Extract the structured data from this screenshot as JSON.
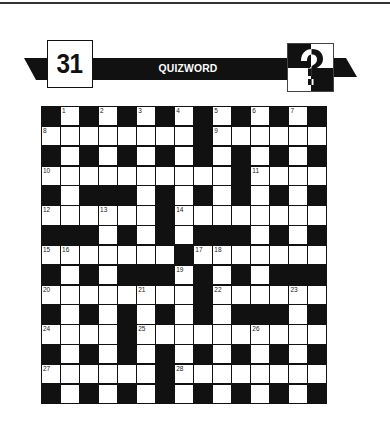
{
  "header": {
    "puzzle_number": "31",
    "title": "QUIZWORD",
    "logo_icon": "question-mark-icon"
  },
  "colors": {
    "ink": "#111111",
    "paper": "#ffffff"
  },
  "grid": {
    "rows": 15,
    "cols": 15,
    "layout": [
      "#1#2#3#4#5#6#7#",
      "........#......",
      "#.#.#.#.#.#.#.#",
      "..........#....",
      "#.###.#.#.#.#.#",
      "......#........",
      "###.#.#.###.#.#",
      ".......#.......",
      "#.#.###.#.#.###",
      "........#......",
      "#.#.#.#.#.###.#",
      "....#..........",
      "#.#.#.#.#.#.#.#",
      "......#........",
      "#.#.#.#.#.#.#.#"
    ],
    "numbers": [
      {
        "n": "1",
        "r": 0,
        "c": 1
      },
      {
        "n": "2",
        "r": 0,
        "c": 3
      },
      {
        "n": "3",
        "r": 0,
        "c": 5
      },
      {
        "n": "4",
        "r": 0,
        "c": 7
      },
      {
        "n": "5",
        "r": 0,
        "c": 9
      },
      {
        "n": "6",
        "r": 0,
        "c": 11
      },
      {
        "n": "7",
        "r": 0,
        "c": 13
      },
      {
        "n": "8",
        "r": 1,
        "c": 0
      },
      {
        "n": "9",
        "r": 1,
        "c": 9
      },
      {
        "n": "10",
        "r": 3,
        "c": 0
      },
      {
        "n": "11",
        "r": 3,
        "c": 11
      },
      {
        "n": "12",
        "r": 5,
        "c": 0
      },
      {
        "n": "13",
        "r": 5,
        "c": 3
      },
      {
        "n": "14",
        "r": 5,
        "c": 7
      },
      {
        "n": "15",
        "r": 7,
        "c": 0
      },
      {
        "n": "16",
        "r": 7,
        "c": 1
      },
      {
        "n": "17",
        "r": 7,
        "c": 8
      },
      {
        "n": "18",
        "r": 7,
        "c": 9
      },
      {
        "n": "19",
        "r": 8,
        "c": 7
      },
      {
        "n": "20",
        "r": 9,
        "c": 0
      },
      {
        "n": "21",
        "r": 9,
        "c": 5
      },
      {
        "n": "22",
        "r": 9,
        "c": 9
      },
      {
        "n": "23",
        "r": 9,
        "c": 13
      },
      {
        "n": "24",
        "r": 11,
        "c": 0
      },
      {
        "n": "25",
        "r": 11,
        "c": 5
      },
      {
        "n": "26",
        "r": 11,
        "c": 11
      },
      {
        "n": "27",
        "r": 13,
        "c": 0
      },
      {
        "n": "28",
        "r": 13,
        "c": 7
      }
    ]
  }
}
